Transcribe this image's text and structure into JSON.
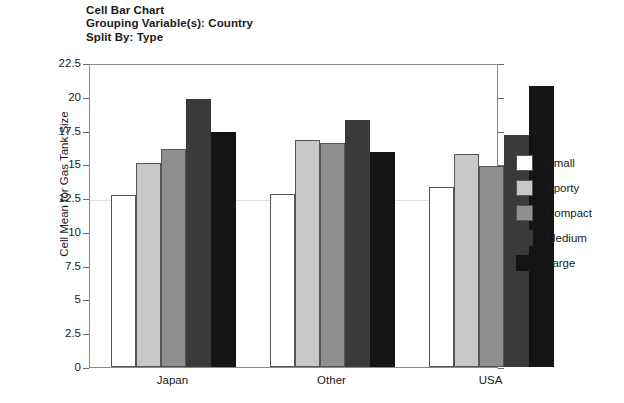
{
  "title": {
    "line1": "Cell Bar Chart",
    "line2": "Grouping Variable(s): Country",
    "line3": "Split By: Type"
  },
  "legend": {
    "items": [
      {
        "label": "Small",
        "color": "#ffffff"
      },
      {
        "label": "Sporty",
        "color": "#c8c8c8"
      },
      {
        "label": "Compact",
        "color": "#8f8f8f"
      },
      {
        "label": "Medium",
        "color": "#3a3a3a"
      },
      {
        "label": "Large",
        "color": "#141414"
      }
    ]
  },
  "chart_data": {
    "type": "bar",
    "title": "Cell Bar Chart",
    "subtitle": "Grouping Variable(s): Country / Split By: Type",
    "xlabel": "",
    "ylabel": "Cell Mean for Gas Tank Size",
    "ylim": [
      0,
      22.5
    ],
    "yticks": [
      0,
      2.5,
      5,
      7.5,
      10,
      12.5,
      15,
      17.5,
      20,
      22.5
    ],
    "ytick_labels": [
      "0",
      "2.5",
      "5",
      "7.5",
      "10",
      "12.5",
      "15",
      "17.5",
      "20",
      "22.5"
    ],
    "grid": false,
    "legend_position": "right",
    "categories": [
      "Japan",
      "Other",
      "USA"
    ],
    "series": [
      {
        "name": "Small",
        "color": "#ffffff",
        "values": [
          12.7,
          12.8,
          13.3
        ]
      },
      {
        "name": "Sporty",
        "color": "#c8c8c8",
        "values": [
          15.1,
          16.8,
          15.8
        ]
      },
      {
        "name": "Compact",
        "color": "#8f8f8f",
        "values": [
          16.1,
          16.6,
          14.9
        ]
      },
      {
        "name": "Medium",
        "color": "#3a3a3a",
        "values": [
          19.85,
          18.3,
          17.2
        ]
      },
      {
        "name": "Large",
        "color": "#141414",
        "values": [
          17.4,
          15.9,
          20.8
        ]
      }
    ]
  }
}
